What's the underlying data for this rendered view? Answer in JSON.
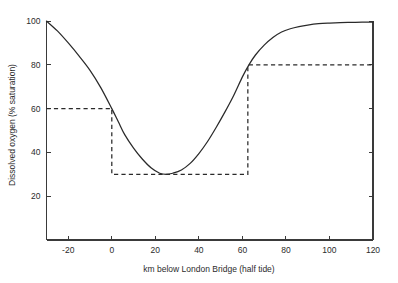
{
  "chart_data": {
    "type": "line",
    "title": "",
    "xlabel": "km below London Bridge (half tide)",
    "ylabel": "Dissolved oxygen (% saturation)",
    "xlim": [
      -30,
      120
    ],
    "ylim": [
      0,
      103
    ],
    "grid": false,
    "legend": "none",
    "xticks": [
      -20,
      0,
      20,
      40,
      60,
      80,
      100,
      120
    ],
    "xtick_labels": [
      "-20",
      "0",
      "20",
      "40",
      "60",
      "80",
      "100",
      "120"
    ],
    "yticks": [
      20,
      40,
      60,
      80,
      100
    ],
    "ytick_labels": [
      "20",
      "40",
      "60",
      "80",
      "100"
    ],
    "series": [
      {
        "name": "Observed dissolved oxygen profile",
        "style": "solid",
        "color": "#2a2a2a",
        "x": [
          -30,
          -25,
          -20,
          -15,
          -10,
          -5,
          0,
          3,
          6,
          10,
          14,
          18,
          22,
          25,
          28,
          32,
          36,
          40,
          44,
          48,
          52,
          56,
          60,
          63,
          66,
          70,
          74,
          78,
          82,
          86,
          90,
          95,
          100,
          105,
          110,
          115,
          120
        ],
        "y": [
          100,
          95.5,
          90,
          84,
          77.5,
          69.5,
          60,
          54,
          48,
          42,
          37,
          33,
          30.5,
          30,
          30.5,
          32,
          35,
          39.5,
          45,
          51.5,
          58.5,
          66,
          74.5,
          80,
          84.5,
          89,
          92.5,
          95,
          96.5,
          97.5,
          98.2,
          98.8,
          99.1,
          99.3,
          99.4,
          99.5,
          99.5
        ]
      },
      {
        "name": "Water quality standard (step)",
        "style": "dashed",
        "color": "#2a2a2a",
        "x": [
          -30,
          0,
          0,
          62.5,
          62.5,
          120
        ],
        "y": [
          60,
          60,
          30,
          30,
          80,
          80
        ]
      }
    ]
  },
  "axes": {
    "y_axis_title": "Dissolved oxygen (% saturation)",
    "x_axis_title": "km below London Bridge (half tide)"
  }
}
